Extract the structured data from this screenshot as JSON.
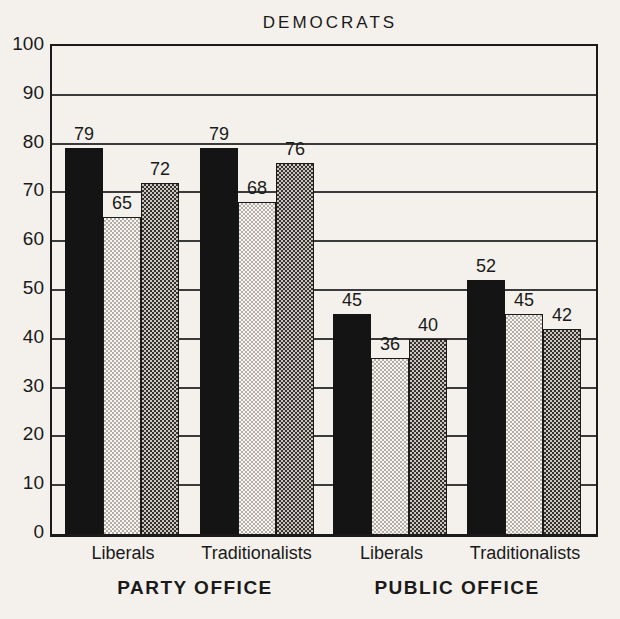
{
  "colors": {
    "paper": "#f4f1ec",
    "ink": "#1a1a1a",
    "grid": "#2b2b2b",
    "stipple-base": "#f7f4ef",
    "stipple-dot": "#b3afa8",
    "checker-base": "#c9c4bd",
    "checker-dark": "#36322d"
  },
  "chart_data": {
    "type": "bar",
    "title": "DEMOCRATS",
    "xlabel": "",
    "ylabel": "",
    "ylim": [
      0,
      100
    ],
    "ytick_step": 10,
    "yticks": [
      0,
      10,
      20,
      30,
      40,
      50,
      60,
      70,
      80,
      90,
      100
    ],
    "grid": "horizontal",
    "legend_position": "none",
    "series_styles": [
      "solid-black",
      "light-stipple-pattern",
      "dark-checker-pattern"
    ],
    "sections": [
      {
        "label": "PARTY OFFICE"
      },
      {
        "label": "PUBLIC OFFICE"
      }
    ],
    "groups": [
      {
        "label": "Liberals",
        "section": "PARTY OFFICE",
        "values": [
          79,
          65,
          72
        ]
      },
      {
        "label": "Traditionalists",
        "section": "PARTY OFFICE",
        "values": [
          79,
          68,
          76
        ]
      },
      {
        "label": "Liberals",
        "section": "PUBLIC OFFICE",
        "values": [
          45,
          36,
          40
        ]
      },
      {
        "label": "Traditionalists",
        "section": "PUBLIC OFFICE",
        "values": [
          52,
          45,
          42
        ]
      }
    ],
    "bar_value_labels_shown": true
  }
}
